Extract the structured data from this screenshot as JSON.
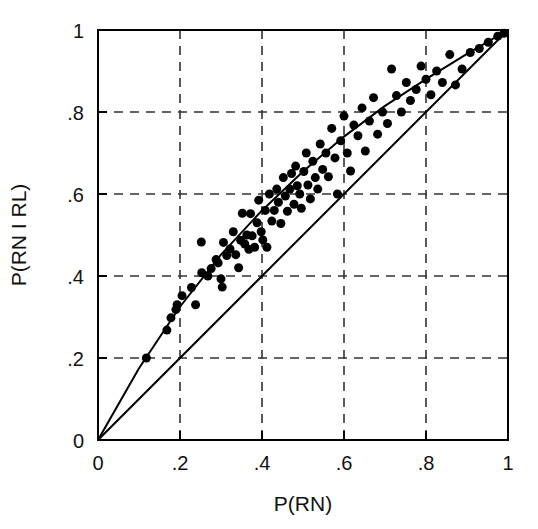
{
  "chart_data": {
    "type": "scatter",
    "title": "",
    "xlabel": "P(RN)",
    "ylabel": "P(RN I RL)",
    "xlim": [
      0,
      1
    ],
    "ylim": [
      0,
      1
    ],
    "grid": true,
    "legend": null,
    "xticks": [
      0,
      0.2,
      0.4,
      0.6,
      0.8,
      1
    ],
    "yticks": [
      0,
      0.2,
      0.4,
      0.6,
      0.8,
      1
    ],
    "xtick_labels": [
      "0",
      ".2",
      ".4",
      ".6",
      ".8",
      "1"
    ],
    "ytick_labels": [
      "0",
      ".2",
      ".4",
      ".6",
      ".8",
      "1"
    ],
    "marker": "filled-circle",
    "marker_color": "#000000",
    "marker_size_px": 9,
    "points": [
      [
        0.118,
        0.2
      ],
      [
        0.168,
        0.268
      ],
      [
        0.178,
        0.298
      ],
      [
        0.19,
        0.318
      ],
      [
        0.193,
        0.33
      ],
      [
        0.205,
        0.352
      ],
      [
        0.228,
        0.372
      ],
      [
        0.238,
        0.33
      ],
      [
        0.252,
        0.483
      ],
      [
        0.253,
        0.408
      ],
      [
        0.268,
        0.4
      ],
      [
        0.276,
        0.418
      ],
      [
        0.288,
        0.44
      ],
      [
        0.293,
        0.432
      ],
      [
        0.3,
        0.393
      ],
      [
        0.303,
        0.373
      ],
      [
        0.306,
        0.482
      ],
      [
        0.314,
        0.45
      ],
      [
        0.322,
        0.466
      ],
      [
        0.33,
        0.508
      ],
      [
        0.336,
        0.452
      ],
      [
        0.343,
        0.42
      ],
      [
        0.348,
        0.487
      ],
      [
        0.352,
        0.553
      ],
      [
        0.358,
        0.478
      ],
      [
        0.363,
        0.5
      ],
      [
        0.368,
        0.465
      ],
      [
        0.372,
        0.552
      ],
      [
        0.376,
        0.498
      ],
      [
        0.382,
        0.47
      ],
      [
        0.388,
        0.53
      ],
      [
        0.392,
        0.585
      ],
      [
        0.398,
        0.508
      ],
      [
        0.402,
        0.488
      ],
      [
        0.408,
        0.56
      ],
      [
        0.412,
        0.47
      ],
      [
        0.418,
        0.6
      ],
      [
        0.424,
        0.534
      ],
      [
        0.43,
        0.56
      ],
      [
        0.436,
        0.612
      ],
      [
        0.44,
        0.58
      ],
      [
        0.446,
        0.528
      ],
      [
        0.452,
        0.64
      ],
      [
        0.457,
        0.595
      ],
      [
        0.462,
        0.558
      ],
      [
        0.468,
        0.612
      ],
      [
        0.472,
        0.65
      ],
      [
        0.478,
        0.575
      ],
      [
        0.482,
        0.668
      ],
      [
        0.486,
        0.62
      ],
      [
        0.492,
        0.6
      ],
      [
        0.496,
        0.565
      ],
      [
        0.502,
        0.655
      ],
      [
        0.508,
        0.7
      ],
      [
        0.512,
        0.622
      ],
      [
        0.518,
        0.588
      ],
      [
        0.524,
        0.68
      ],
      [
        0.53,
        0.64
      ],
      [
        0.536,
        0.612
      ],
      [
        0.542,
        0.722
      ],
      [
        0.548,
        0.66
      ],
      [
        0.556,
        0.7
      ],
      [
        0.562,
        0.642
      ],
      [
        0.57,
        0.76
      ],
      [
        0.578,
        0.688
      ],
      [
        0.584,
        0.6
      ],
      [
        0.592,
        0.73
      ],
      [
        0.6,
        0.79
      ],
      [
        0.608,
        0.7
      ],
      [
        0.616,
        0.656
      ],
      [
        0.624,
        0.768
      ],
      [
        0.634,
        0.742
      ],
      [
        0.644,
        0.81
      ],
      [
        0.652,
        0.705
      ],
      [
        0.662,
        0.778
      ],
      [
        0.672,
        0.835
      ],
      [
        0.682,
        0.746
      ],
      [
        0.694,
        0.8
      ],
      [
        0.706,
        0.772
      ],
      [
        0.716,
        0.905
      ],
      [
        0.728,
        0.84
      ],
      [
        0.74,
        0.8
      ],
      [
        0.752,
        0.872
      ],
      [
        0.762,
        0.828
      ],
      [
        0.776,
        0.855
      ],
      [
        0.788,
        0.912
      ],
      [
        0.8,
        0.88
      ],
      [
        0.812,
        0.842
      ],
      [
        0.826,
        0.9
      ],
      [
        0.84,
        0.872
      ],
      [
        0.858,
        0.94
      ],
      [
        0.872,
        0.866
      ],
      [
        0.888,
        0.905
      ],
      [
        0.908,
        0.945
      ],
      [
        0.93,
        0.955
      ],
      [
        0.952,
        0.97
      ],
      [
        0.975,
        0.985
      ],
      [
        0.99,
        0.992
      ]
    ],
    "lines": [
      {
        "name": "identity-line",
        "from": [
          0,
          0
        ],
        "to": [
          1,
          1
        ],
        "style": "solid",
        "color": "#000000",
        "width_px": 2
      },
      {
        "name": "fitted-curve",
        "style": "solid",
        "color": "#000000",
        "width_px": 2,
        "points": [
          [
            0.0,
            0.0
          ],
          [
            0.1,
            0.175
          ],
          [
            0.2,
            0.325
          ],
          [
            0.3,
            0.452
          ],
          [
            0.4,
            0.56
          ],
          [
            0.5,
            0.655
          ],
          [
            0.6,
            0.74
          ],
          [
            0.7,
            0.815
          ],
          [
            0.8,
            0.88
          ],
          [
            0.9,
            0.942
          ],
          [
            1.0,
            1.0
          ]
        ]
      }
    ]
  },
  "figure": {
    "background_color": "#ffffff",
    "axis_color": "#000000",
    "grid_color": "#333333"
  }
}
